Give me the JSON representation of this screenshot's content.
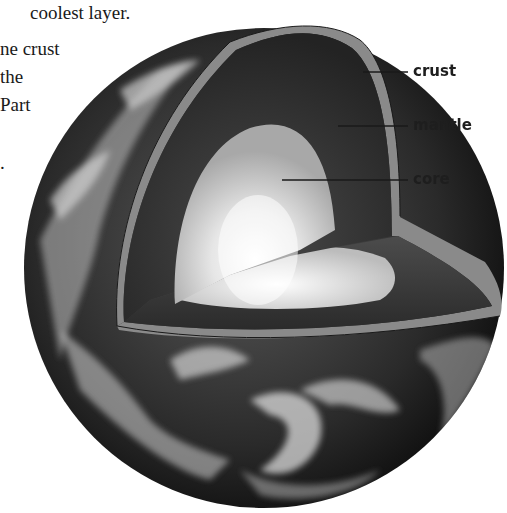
{
  "text_fragments": [
    {
      "text": "coolest layer.",
      "x": 30,
      "y": 0
    },
    {
      "text": "ne crust",
      "x": 0,
      "y": 36
    },
    {
      "text": " the",
      "x": 0,
      "y": 64
    },
    {
      "text": "Part",
      "x": 0,
      "y": 92
    },
    {
      "text": ".",
      "x": 0,
      "y": 150
    }
  ],
  "diagram": {
    "labels": [
      {
        "id": "crust",
        "text": "crust"
      },
      {
        "id": "mantle",
        "text": "mantle"
      },
      {
        "id": "core",
        "text": "core"
      }
    ],
    "colors": {
      "background": "#ffffff",
      "crust": "#8a8a8a",
      "mantle": "#2e2e2e",
      "core_outer": "#bdbdbd",
      "core_inner": "#f6f6f6",
      "leader_line": "#1a1a1a",
      "label_text": "#1e1e1e"
    }
  }
}
